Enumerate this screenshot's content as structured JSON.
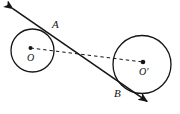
{
  "figure": {
    "kind": "geometry-diagram",
    "canvas": {
      "width": 180,
      "height": 114,
      "background": "#ffffff"
    },
    "stroke_color": "#151515",
    "fill_color": "#151515",
    "labels": {
      "point_a": "A",
      "point_b": "B",
      "center_left": "O",
      "center_right": "O'"
    },
    "circles": [
      {
        "id": "left-circle",
        "label": "O",
        "cx": 32.5,
        "cy": 50.5,
        "r": 21.5,
        "stroke_width": 1.3
      },
      {
        "id": "right-circle",
        "label": "O'",
        "cx": 142.0,
        "cy": 64.5,
        "r": 29.0,
        "stroke_width": 1.3
      }
    ],
    "centers": [
      {
        "id": "center-dot-left",
        "label": "O",
        "cx": 30.5,
        "cy": 48.0,
        "r": 2.0
      },
      {
        "id": "center-dot-right",
        "label": "O'",
        "cx": 143.0,
        "cy": 62.0,
        "r": 2.3
      }
    ],
    "tangent_points": [
      {
        "id": "point-a",
        "label": "A",
        "x": 47.0,
        "y": 31.0
      },
      {
        "id": "point-b",
        "label": "B",
        "x": 122.0,
        "y": 84.0
      }
    ],
    "tangent_line": {
      "id": "tangent-line",
      "x1": 9.0,
      "y1": 6.0,
      "x2": 151.0,
      "y2": 104.0,
      "stroke_width": 1.6,
      "arrow_start": true,
      "arrow_end": true
    },
    "center_line": {
      "id": "center-line",
      "x1": 30.5,
      "y1": 48.0,
      "x2": 143.0,
      "y2": 62.0,
      "dash": "3.4 3.0",
      "stroke_width": 1.0
    },
    "label_positions": {
      "point_a": {
        "x": 52.0,
        "y": 19.0
      },
      "point_b": {
        "x": 114.0,
        "y": 88.0
      },
      "center_left": {
        "x": 27.0,
        "y": 53.0
      },
      "center_right": {
        "x": 139.0,
        "y": 67.0
      }
    }
  }
}
